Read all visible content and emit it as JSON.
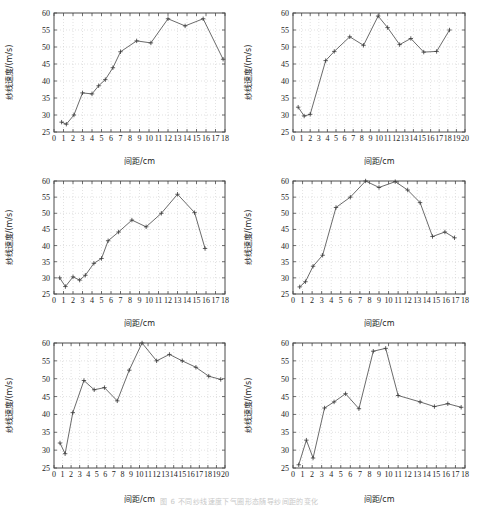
{
  "figure": {
    "title": "",
    "caption": "图 6  不同纱线速度下气圈形态随导纱间距的变化",
    "panel_count": 6,
    "axis_titles": {
      "x": "间距/cm",
      "y": "纱线速度/(m/s)"
    }
  },
  "chart_data": [
    {
      "type": "line",
      "title": "",
      "xlabel": "间距/cm",
      "ylabel": "纱线速度/(m/s)",
      "xlim": [
        0,
        18
      ],
      "ylim": [
        25,
        60
      ],
      "xticks": [
        0,
        1,
        2,
        3,
        4,
        5,
        6,
        7,
        8,
        9,
        10,
        11,
        12,
        13,
        14,
        15,
        16,
        17,
        18
      ],
      "yticks": [
        25,
        30,
        35,
        40,
        45,
        50,
        55,
        60
      ],
      "grid": true,
      "legend": "none",
      "marker": "plus",
      "x": [
        0.8,
        1.3,
        2.1,
        3.0,
        4.0,
        4.7,
        5.4,
        6.2,
        7.0,
        8.7,
        10.2,
        12.0,
        13.8,
        15.7,
        17.8
      ],
      "y": [
        27.9,
        27.3,
        30.0,
        36.5,
        36.2,
        38.6,
        40.4,
        43.9,
        48.6,
        51.8,
        51.2,
        58.3,
        56.2,
        58.3,
        46.4
      ]
    },
    {
      "type": "line",
      "title": "",
      "xlabel": "间距/cm",
      "ylabel": "纱线速度/(m/s)",
      "xlim": [
        0,
        20
      ],
      "ylim": [
        25,
        60
      ],
      "xticks": [
        0,
        1,
        2,
        3,
        4,
        5,
        6,
        7,
        8,
        9,
        10,
        11,
        12,
        13,
        14,
        15,
        16,
        17,
        18,
        19,
        20
      ],
      "yticks": [
        25,
        30,
        35,
        40,
        45,
        50,
        55,
        60
      ],
      "grid": true,
      "legend": "none",
      "marker": "plus",
      "x": [
        0.6,
        1.3,
        2.0,
        3.8,
        4.8,
        6.6,
        8.2,
        9.9,
        11.0,
        12.4,
        13.7,
        15.2,
        16.7,
        18.2
      ],
      "y": [
        32.3,
        29.7,
        30.2,
        46.0,
        48.7,
        53.0,
        50.5,
        59.1,
        55.7,
        50.7,
        52.5,
        48.5,
        48.7,
        55.0
      ]
    },
    {
      "type": "line",
      "title": "",
      "xlabel": "间距/cm",
      "ylabel": "纱线速度/(m/s)",
      "xlim": [
        0,
        18
      ],
      "ylim": [
        25,
        60
      ],
      "xticks": [
        0,
        1,
        2,
        3,
        4,
        5,
        6,
        7,
        8,
        9,
        10,
        11,
        12,
        13,
        14,
        15,
        16,
        17,
        18
      ],
      "yticks": [
        25,
        30,
        35,
        40,
        45,
        50,
        55,
        60
      ],
      "grid": true,
      "legend": "none",
      "marker": "plus",
      "x": [
        0.6,
        1.2,
        2.0,
        2.7,
        3.3,
        4.2,
        5.0,
        5.7,
        6.8,
        8.2,
        9.7,
        11.3,
        13.0,
        14.8,
        15.9
      ],
      "y": [
        30.0,
        27.3,
        30.3,
        29.3,
        30.8,
        34.5,
        36.0,
        41.5,
        44.2,
        47.9,
        45.8,
        50.0,
        55.9,
        50.2,
        39.1
      ]
    },
    {
      "type": "line",
      "title": "",
      "xlabel": "间距/cm",
      "ylabel": "纱线速度/(m/s)",
      "xlim": [
        0,
        18
      ],
      "ylim": [
        25,
        60
      ],
      "xticks": [
        0,
        1,
        2,
        3,
        4,
        5,
        6,
        7,
        8,
        9,
        10,
        11,
        12,
        13,
        14,
        15,
        16,
        17,
        18
      ],
      "yticks": [
        25,
        30,
        35,
        40,
        45,
        50,
        55,
        60
      ],
      "grid": true,
      "legend": "none",
      "marker": "plus",
      "x": [
        0.7,
        1.3,
        2.1,
        3.1,
        4.5,
        6.0,
        7.6,
        9.0,
        10.7,
        12.0,
        13.3,
        14.6,
        15.9,
        16.9
      ],
      "y": [
        27.2,
        28.8,
        33.6,
        37.0,
        51.8,
        55.0,
        60.0,
        58.0,
        59.8,
        57.2,
        53.3,
        42.8,
        44.2,
        42.4
      ]
    },
    {
      "type": "line",
      "title": "",
      "xlabel": "间距/cm",
      "ylabel": "纱线速度/(m/s)",
      "xlim": [
        0,
        20
      ],
      "ylim": [
        25,
        60
      ],
      "xticks": [
        0,
        1,
        2,
        3,
        4,
        5,
        6,
        7,
        8,
        9,
        10,
        11,
        12,
        13,
        14,
        15,
        16,
        17,
        18,
        19,
        20
      ],
      "yticks": [
        25,
        30,
        35,
        40,
        45,
        50,
        55,
        60
      ],
      "grid": true,
      "legend": "none",
      "marker": "plus",
      "x": [
        0.7,
        1.3,
        2.2,
        3.5,
        4.7,
        5.9,
        7.4,
        8.8,
        10.3,
        12.0,
        13.5,
        15.0,
        16.6,
        18.1,
        19.5
      ],
      "y": [
        32.0,
        29.0,
        40.5,
        49.5,
        46.9,
        47.5,
        43.8,
        52.4,
        60.0,
        55.0,
        56.8,
        55.0,
        53.2,
        50.7,
        49.8
      ]
    },
    {
      "type": "line",
      "title": "",
      "xlabel": "间距/cm",
      "ylabel": "纱线速度/(m/s)",
      "xlim": [
        0,
        18
      ],
      "ylim": [
        25,
        60
      ],
      "xticks": [
        0,
        1,
        2,
        3,
        4,
        5,
        6,
        7,
        8,
        9,
        10,
        11,
        12,
        13,
        14,
        15,
        16,
        17,
        18
      ],
      "yticks": [
        25,
        30,
        35,
        40,
        45,
        50,
        55,
        60
      ],
      "grid": true,
      "legend": "none",
      "marker": "plus",
      "x": [
        0.6,
        1.4,
        2.1,
        3.3,
        4.3,
        5.5,
        6.9,
        8.4,
        9.7,
        11.0,
        13.3,
        14.8,
        16.2,
        17.6
      ],
      "y": [
        25.9,
        32.8,
        27.8,
        41.8,
        43.5,
        45.8,
        41.6,
        57.7,
        58.5,
        45.3,
        43.5,
        42.2,
        43.0,
        42.0
      ]
    }
  ]
}
